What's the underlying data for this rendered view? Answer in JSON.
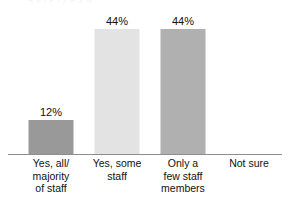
{
  "top_clipped_text": "q g  j        p                              , y   p   y     q",
  "chart_data": {
    "type": "bar",
    "title": "",
    "subtitle": "",
    "xlabel": "",
    "ylabel": "",
    "ylim": [
      0,
      50
    ],
    "grid": false,
    "legend": "none",
    "categories": [
      "Yes, all/ majority of staff",
      "Yes, some staff",
      "Only a few staff members",
      "Not sure"
    ],
    "category_lines": [
      [
        "Yes, all/",
        "majority",
        "of staff"
      ],
      [
        "Yes, some",
        "staff"
      ],
      [
        "Only a",
        "few staff",
        "members"
      ],
      [
        "Not sure"
      ]
    ],
    "values": [
      12,
      44,
      44,
      0
    ],
    "value_labels": [
      "12%",
      "44%",
      "44%",
      ""
    ],
    "bar_colors": [
      "#999999",
      "#e3e3e3",
      "#b0b0b0",
      "#ffffff"
    ],
    "axis_color": "#8d8d8d",
    "text_color": "#111111"
  }
}
